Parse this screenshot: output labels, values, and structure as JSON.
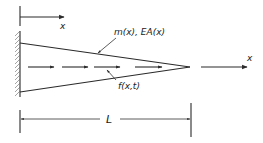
{
  "diagram": {
    "labels": {
      "top_axis": "x",
      "right_axis": "x",
      "properties": "m(x), EA(x)",
      "load": "f(x,t)",
      "length": "L"
    },
    "elements": {
      "support": "fixed-wall (hatched)",
      "body": "tapered bar (triangle narrowing to tip)",
      "distributed_load": "dashed arrows along centerline pointing in +x",
      "dimension": "length L from wall to tip"
    },
    "colors": {
      "line": "#2a2a2a",
      "background": "#ffffff"
    }
  }
}
